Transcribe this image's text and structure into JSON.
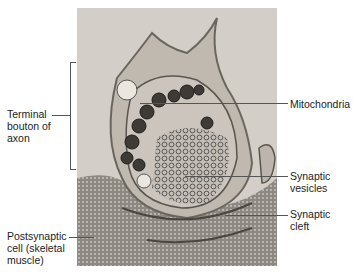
{
  "figure": {
    "type": "electron micrograph"
  },
  "labels": {
    "terminal_bouton": "Terminal bouton of axon",
    "terminal_bouton_lines": [
      "Terminal",
      "bouton of",
      "axon"
    ],
    "postsynaptic_cell_lines": [
      "Postsynaptic",
      "cell (skeletal",
      "muscle)"
    ],
    "mitochondria": "Mitochondria",
    "synaptic_vesicles_lines": [
      "Synaptic",
      "vesicles"
    ],
    "synaptic_cleft_lines": [
      "Synaptic",
      "cleft"
    ]
  },
  "colors": {
    "background": "#ffffff",
    "micrograph_base": "#cfcac3",
    "label_text": "#222222",
    "leader_line": "#555555"
  }
}
